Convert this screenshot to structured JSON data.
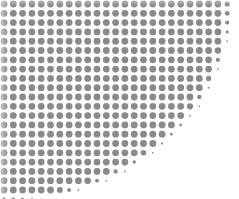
{
  "graphic": {
    "type": "halftone-dot-quarter-ellipse",
    "dot_color": "#8a8a8a",
    "background_color": "#ffffff",
    "dot_pitch": 9.3,
    "dot_radius": 3.4,
    "offset_x": 4,
    "offset_y": 4,
    "ellipse": {
      "cx": 0,
      "cy": 0,
      "rx": 232,
      "ry": 202
    }
  }
}
